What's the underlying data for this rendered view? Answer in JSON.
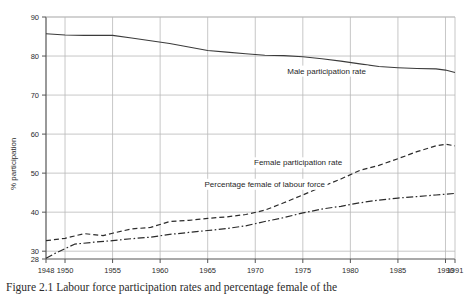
{
  "figure": {
    "caption": "Figure 2.1 Labour force participation rates and percentage female of the"
  },
  "chart_data": {
    "type": "line",
    "title": "",
    "xlabel": "",
    "ylabel": "% participation",
    "xlim": [
      1948,
      1991
    ],
    "ylim": [
      28,
      90
    ],
    "grid": true,
    "legend_position": "inline-annotations",
    "xticks": [
      1948,
      1950,
      1955,
      1960,
      1965,
      1970,
      1975,
      1980,
      1985,
      1990,
      1991
    ],
    "xticklabels": [
      "1948",
      "1950",
      "1955",
      "1960",
      "1965",
      "1970",
      "1975",
      "1980",
      "1985",
      "1990",
      "1991"
    ],
    "yticks": [
      28,
      30,
      40,
      50,
      60,
      70,
      80,
      90
    ],
    "yticklabels": [
      "28",
      "30",
      "40",
      "50",
      "60",
      "70",
      "80",
      "90"
    ],
    "series": [
      {
        "name": "Male participation rate",
        "label": "Male participation rate",
        "style": "solid",
        "color": "#3b3b3b",
        "label_x": 1977.5,
        "label_y": 75.5,
        "x": [
          1948,
          1950,
          1952,
          1955,
          1957,
          1959,
          1961,
          1963,
          1965,
          1967,
          1969,
          1971,
          1973,
          1975,
          1977,
          1979,
          1981,
          1983,
          1985,
          1987,
          1989,
          1990,
          1991
        ],
        "values": [
          85.7,
          85.4,
          85.3,
          85.3,
          84.6,
          83.9,
          83.2,
          82.3,
          81.4,
          81.0,
          80.6,
          80.2,
          80.1,
          79.8,
          79.3,
          78.7,
          78.0,
          77.3,
          77.0,
          76.8,
          76.7,
          76.4,
          75.8
        ]
      },
      {
        "name": "Female participation rate",
        "label": "Female participation rate",
        "style": "dashed",
        "color": "#2b2b2b",
        "label_x": 1974.5,
        "label_y": 52.0,
        "x": [
          1948,
          1950,
          1952,
          1954,
          1955,
          1957,
          1959,
          1961,
          1963,
          1965,
          1967,
          1969,
          1971,
          1973,
          1975,
          1977,
          1979,
          1981,
          1983,
          1985,
          1987,
          1989,
          1990,
          1991
        ],
        "values": [
          32.7,
          33.3,
          34.5,
          34.0,
          34.6,
          35.7,
          36.1,
          37.6,
          37.9,
          38.4,
          38.8,
          39.4,
          40.5,
          42.4,
          44.4,
          46.5,
          48.5,
          50.7,
          52.0,
          53.7,
          55.5,
          57.0,
          57.4,
          57.0
        ]
      },
      {
        "name": "Percentage female of labour force",
        "label": "Percentage female of labour force",
        "style": "dashdot",
        "color": "#2b2b2b",
        "label_x": 1971.0,
        "label_y": 46.5,
        "x": [
          1948,
          1949,
          1951,
          1953,
          1955,
          1957,
          1959,
          1961,
          1963,
          1965,
          1967,
          1969,
          1971,
          1973,
          1975,
          1977,
          1979,
          1981,
          1983,
          1985,
          1987,
          1989,
          1990,
          1991
        ],
        "values": [
          28.2,
          29.5,
          31.8,
          32.3,
          32.7,
          33.2,
          33.6,
          34.3,
          34.8,
          35.3,
          35.8,
          36.5,
          37.6,
          38.6,
          39.8,
          40.8,
          41.5,
          42.4,
          43.1,
          43.6,
          44.0,
          44.4,
          44.6,
          44.8
        ]
      }
    ]
  }
}
